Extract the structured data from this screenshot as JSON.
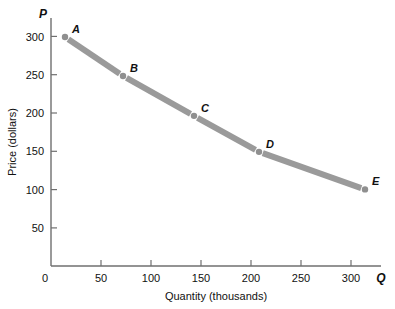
{
  "chart_data": {
    "type": "line",
    "title": "",
    "xlabel": "Quantity (thousands)",
    "ylabel": "Price (dollars)",
    "x_axis_symbol": "Q",
    "y_axis_symbol": "P",
    "xlim": [
      0,
      330
    ],
    "ylim": [
      0,
      320
    ],
    "xticks": [
      0,
      50,
      100,
      150,
      200,
      250,
      300
    ],
    "xticklabels": [
      "0",
      "50",
      "100",
      "150",
      "200",
      "250",
      "300"
    ],
    "yticks": [
      50,
      100,
      150,
      200,
      250,
      300
    ],
    "yticklabels": [
      "50",
      "100",
      "150",
      "200",
      "250",
      "300"
    ],
    "grid": false,
    "legend": "none",
    "series": [
      {
        "name": "Demand",
        "color": "#9a9a9a",
        "point_color": "#8f8f8f",
        "points": [
          {
            "label": "A",
            "x": 14,
            "y": 299
          },
          {
            "label": "B",
            "x": 72,
            "y": 248
          },
          {
            "label": "C",
            "x": 143,
            "y": 196
          },
          {
            "label": "D",
            "x": 208,
            "y": 149
          },
          {
            "label": "E",
            "x": 314,
            "y": 100
          }
        ]
      }
    ]
  },
  "axes": {
    "axis_color": "#6f6f6f"
  }
}
